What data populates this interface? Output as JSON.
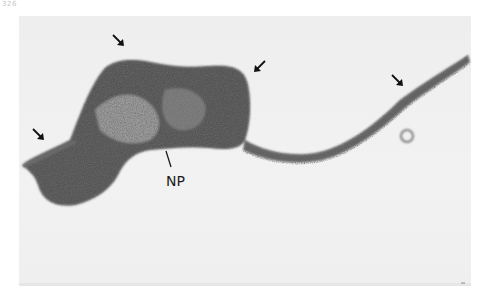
{
  "figure": {
    "page_number": "326",
    "labels": {
      "nuclear_pore": "NP"
    },
    "arrows": [
      {
        "name": "arrow-left",
        "x": 40,
        "y": 135,
        "direction": "down-right"
      },
      {
        "name": "arrow-top",
        "x": 120,
        "y": 42,
        "direction": "down-right"
      },
      {
        "name": "arrow-middle",
        "x": 260,
        "y": 68,
        "direction": "down-left"
      },
      {
        "name": "arrow-right",
        "x": 400,
        "y": 82,
        "direction": "down-right"
      }
    ],
    "colors": {
      "background": "#f0f0f0",
      "specimen_dark": "#2a2a2a",
      "specimen_mid": "#555555"
    }
  }
}
